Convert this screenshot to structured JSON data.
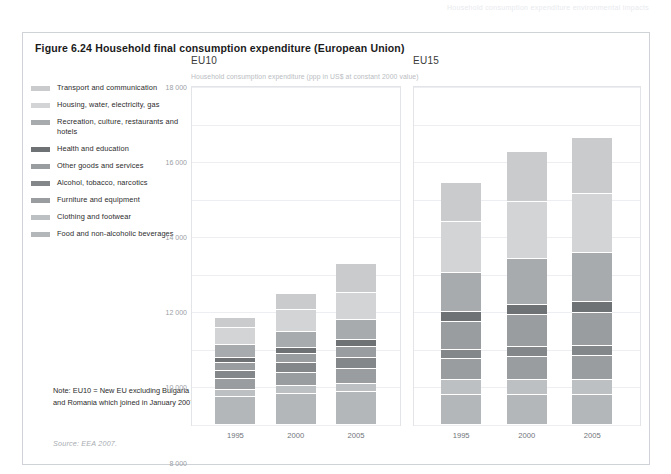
{
  "page_header": "Household consumption expenditure environmental impacts",
  "figure": {
    "title": "Figure 6.24 Household final consumption expenditure (European Union)",
    "note": "Note: EU10 = New EU excluding Bulgaria and Romania which joined in January 2007.",
    "source": "Source: EEA 2007."
  },
  "legend": {
    "items": [
      {
        "label": "Transport and communication",
        "color": "#c9cbcd"
      },
      {
        "label": "Housing, water, electricity, gas",
        "color": "#d2d4d6"
      },
      {
        "label": "Recreation, culture, restaurants and hotels",
        "color": "#a8abae"
      },
      {
        "label": "Health and education",
        "color": "#6e7275"
      },
      {
        "label": "Other goods and services",
        "color": "#9a9da0"
      },
      {
        "label": "Alcohol, tobacco, narcotics",
        "color": "#84878a"
      },
      {
        "label": "Furniture and equipment",
        "color": "#9a9da0"
      },
      {
        "label": "Clothing and footwear",
        "color": "#bdc0c2"
      },
      {
        "label": "Food and non-alcoholic beverages",
        "color": "#b4b7ba"
      }
    ]
  },
  "chart_data": {
    "type": "bar",
    "title": "Household final consumption expenditure (European Union)",
    "subtitle": "Household consumption expenditure (ppp in US$ at constant 2000 value)",
    "ylabel": "Household consumption expenditure (ppp in US$ at constant 2000 value)",
    "xlabel": "",
    "ylim": [
      0,
      18000
    ],
    "yticks": [
      "0",
      "2 000",
      "4 000",
      "6 000",
      "8 000",
      "10 000",
      "12 000",
      "14 000",
      "16 000",
      "18 000"
    ],
    "ytick_values": [
      0,
      2000,
      4000,
      6000,
      8000,
      10000,
      12000,
      14000,
      16000,
      18000
    ],
    "grid": true,
    "legend_position": "left",
    "stacked": true,
    "series": [
      {
        "name": "Food and non-alcoholic beverages",
        "color": "#b4b7ba",
        "EU10": [
          1500,
          1650,
          1750
        ],
        "EU15": [
          1600,
          1600,
          1600
        ]
      },
      {
        "name": "Clothing and footwear",
        "color": "#bdc0c2",
        "EU10": [
          350,
          400,
          420
        ],
        "EU15": [
          800,
          800,
          800
        ]
      },
      {
        "name": "Furniture and equipment",
        "color": "#9a9da0",
        "EU10": [
          600,
          700,
          800
        ],
        "EU15": [
          1100,
          1200,
          1250
        ]
      },
      {
        "name": "Alcohol, tobacco, narcotics",
        "color": "#84878a",
        "EU10": [
          450,
          550,
          600
        ],
        "EU15": [
          500,
          550,
          550
        ]
      },
      {
        "name": "Other goods and services",
        "color": "#9a9da0",
        "EU10": [
          400,
          500,
          600
        ],
        "EU15": [
          1500,
          1700,
          1750
        ]
      },
      {
        "name": "Health and education",
        "color": "#6e7275",
        "EU10": [
          250,
          300,
          350
        ],
        "EU15": [
          500,
          550,
          600
        ]
      },
      {
        "name": "Recreation, culture, restaurants and hotels",
        "color": "#a8abae",
        "EU10": [
          700,
          850,
          1050
        ],
        "EU15": [
          2100,
          2450,
          2600
        ]
      },
      {
        "name": "Housing, water, electricity, gas",
        "color": "#d2d4d6",
        "EU10": [
          900,
          1150,
          1450
        ],
        "EU15": [
          2700,
          3000,
          3150
        ]
      },
      {
        "name": "Transport and communication",
        "color": "#c9cbcd",
        "EU10": [
          550,
          900,
          1530
        ],
        "EU15": [
          2100,
          2700,
          3000
        ]
      }
    ],
    "panels": [
      {
        "name": "EU10",
        "title": "EU10",
        "categories": [
          "1995",
          "2000",
          "2005"
        ],
        "totals": [
          5700,
          7000,
          8550
        ]
      },
      {
        "name": "EU15",
        "title": "EU15",
        "categories": [
          "1995",
          "2000",
          "2005"
        ],
        "totals": [
          12900,
          14550,
          15300
        ]
      }
    ]
  }
}
